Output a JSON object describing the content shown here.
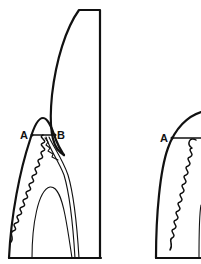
{
  "figure": {
    "colors": {
      "ink": "#111111",
      "background": "#ffffff"
    },
    "left_panel": {
      "labels": {
        "point_a": "A",
        "point_b": "B"
      }
    },
    "right_panel": {
      "labels": {
        "point_a": "A"
      }
    }
  }
}
